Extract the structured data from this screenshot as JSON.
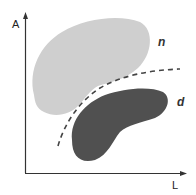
{
  "axes": {
    "y_label": "A",
    "x_label": "L"
  },
  "regions": [
    {
      "label": "n",
      "fill": "#cfcfcf",
      "description": "light region"
    },
    {
      "label": "d",
      "fill": "#505050",
      "description": "dark region"
    }
  ],
  "boundary": {
    "style": "dashed",
    "color": "#444444"
  },
  "colors": {
    "axis": "#333333",
    "background": "#ffffff"
  }
}
